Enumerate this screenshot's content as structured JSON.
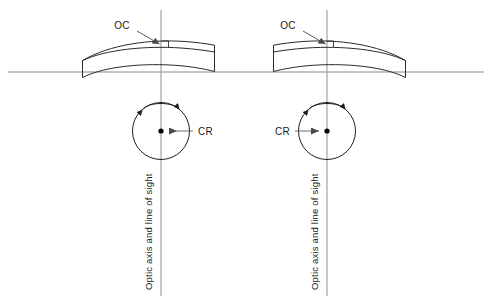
{
  "figure": {
    "background_color": "#ffffff",
    "width": 492,
    "height": 305,
    "line_color": "#1f1f1f",
    "axis_color": "#8a8a8a",
    "leader_color": "#4a4a4a"
  },
  "labels": {
    "optical_centre": "OC",
    "centre_of_rotation": "CR",
    "axis_label": "Optic axis and line of sight"
  },
  "panels": [
    {
      "id": "left-panel",
      "name": "left-eye-diagram",
      "axis_x": 161,
      "horizon_y": 72,
      "oc_label_x": 122,
      "oc_label_y": 29,
      "cr_label_x": 198,
      "cr_label_y": 132,
      "cr_dot_x": 161,
      "cr_dot_y": 131,
      "arrow_direction": "left",
      "axis_text_x": 152,
      "axis_text_y": 290
    },
    {
      "id": "right-panel",
      "name": "right-eye-diagram",
      "axis_x": 327,
      "horizon_y": 72,
      "oc_label_x": 288,
      "oc_label_y": 29,
      "cr_label_x": 268,
      "cr_label_y": 132,
      "cr_dot_x": 327,
      "cr_dot_y": 131,
      "arrow_direction": "right",
      "axis_text_x": 318,
      "axis_text_y": 290
    }
  ]
}
